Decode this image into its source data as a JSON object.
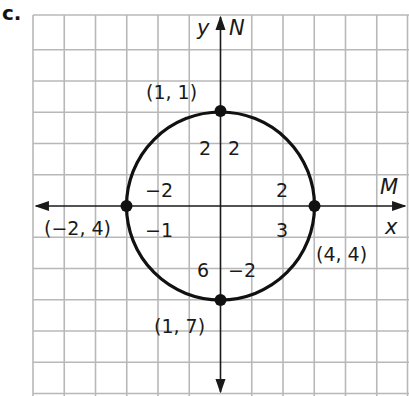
{
  "part_label": "c.",
  "axes": {
    "y_label": "y",
    "y_alt_label": "N",
    "x_label": "x",
    "x_alt_label": "M"
  },
  "figure": {
    "type": "circle-on-grid",
    "grid_spacing_px": 31.25,
    "circle_center_grid": [
      0,
      0
    ],
    "circle_radius_grid_units": 3,
    "colors": {
      "grid": "#b8b8b8",
      "axes": "#1a1a1a",
      "curve": "#111111"
    }
  },
  "points": [
    {
      "name": "top",
      "label": "(1, 1)"
    },
    {
      "name": "left",
      "label": "(−2, 4)"
    },
    {
      "name": "right",
      "label": "(4, 4)"
    },
    {
      "name": "bottom",
      "label": "(1, 7)"
    }
  ],
  "annotations": {
    "top_left_of_axis": "2",
    "top_right_of_axis": "2",
    "left_above_x": "−2",
    "left_below_x": "−1",
    "right_above_x": "2",
    "right_below_x": "3",
    "bottom_left_of_axis": "6",
    "bottom_right_of_axis": "−2"
  }
}
